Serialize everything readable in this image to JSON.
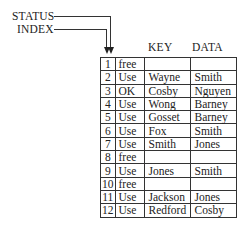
{
  "labels": {
    "status": "STATUS",
    "index": "INDEX"
  },
  "headers": {
    "key": "KEY",
    "data": "DATA"
  },
  "rows": [
    {
      "index": "1",
      "status": "free",
      "key": "",
      "data": ""
    },
    {
      "index": "2",
      "status": "Use",
      "key": "Wayne",
      "data": "Smith"
    },
    {
      "index": "3",
      "status": "OK",
      "key": "Cosby",
      "data": "Nguyen"
    },
    {
      "index": "4",
      "status": "Use",
      "key": "Wong",
      "data": "Barney"
    },
    {
      "index": "5",
      "status": "Use",
      "key": "Gosset",
      "data": "Barney"
    },
    {
      "index": "6",
      "status": "Use",
      "key": "Fox",
      "data": "Smith"
    },
    {
      "index": "7",
      "status": "Use",
      "key": "Smith",
      "data": "Jones"
    },
    {
      "index": "8",
      "status": "free",
      "key": "",
      "data": ""
    },
    {
      "index": "9",
      "status": "Use",
      "key": "Jones",
      "data": "Smith"
    },
    {
      "index": "10",
      "status": "free",
      "key": "",
      "data": ""
    },
    {
      "index": "11",
      "status": "Use",
      "key": "Jackson",
      "data": "Jones"
    },
    {
      "index": "12",
      "status": "Use",
      "key": "Redford",
      "data": "Cosby"
    }
  ]
}
